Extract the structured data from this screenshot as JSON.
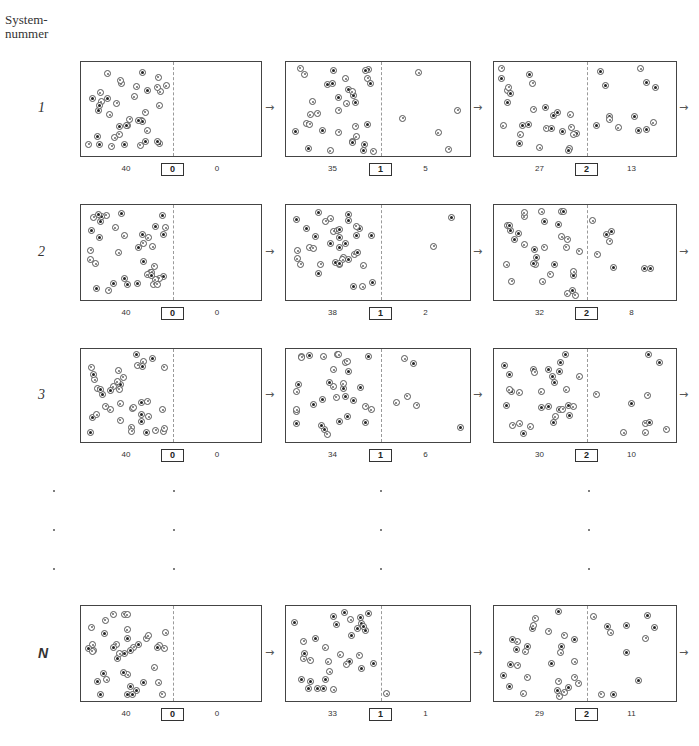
{
  "header": {
    "label_line1": "System-",
    "label_line2": "nummer"
  },
  "layout": {
    "box_columns": [
      {
        "left": 80,
        "width": 182,
        "divider_x": 92
      },
      {
        "left": 285,
        "width": 186,
        "divider_x": 95
      },
      {
        "left": 493,
        "width": 184,
        "divider_x": 93
      }
    ],
    "arrow_x": [
      270,
      478,
      684
    ]
  },
  "rows": [
    {
      "label": "1",
      "top": 61,
      "height": 96,
      "states": [
        {
          "step": "0",
          "left_count": "40",
          "right_count": "0"
        },
        {
          "step": "1",
          "left_count": "35",
          "right_count": "5"
        },
        {
          "step": "2",
          "left_count": "27",
          "right_count": "13"
        }
      ]
    },
    {
      "label": "2",
      "top": 204,
      "height": 97,
      "states": [
        {
          "step": "0",
          "left_count": "40",
          "right_count": "0"
        },
        {
          "step": "1",
          "left_count": "38",
          "right_count": "2"
        },
        {
          "step": "2",
          "left_count": "32",
          "right_count": "8"
        }
      ]
    },
    {
      "label": "3",
      "top": 348,
      "height": 95,
      "states": [
        {
          "step": "0",
          "left_count": "40",
          "right_count": "0"
        },
        {
          "step": "1",
          "left_count": "34",
          "right_count": "6"
        },
        {
          "step": "2",
          "left_count": "30",
          "right_count": "10"
        }
      ]
    },
    {
      "label": "N",
      "top": 605,
      "height": 97,
      "states": [
        {
          "step": "0",
          "left_count": "40",
          "right_count": "0"
        },
        {
          "step": "1",
          "left_count": "33",
          "right_count": "1"
        },
        {
          "step": "2",
          "left_count": "29",
          "right_count": "11"
        }
      ]
    }
  ],
  "ellipsis_rows": [
    {
      "y": 490,
      "xs": [
        53,
        173,
        380,
        588
      ]
    },
    {
      "y": 529,
      "xs": [
        53,
        173,
        380,
        588
      ]
    },
    {
      "y": 568,
      "xs": [
        53,
        173,
        380,
        588
      ]
    }
  ],
  "particles_seed": 7,
  "caption": "Abb.: Ehrenfest-Modell — Systeme mit je 40 Teilchen, Zustand nach Schritt 0, 1, 2"
}
